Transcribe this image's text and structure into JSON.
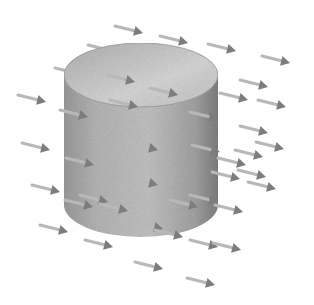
{
  "diagram": {
    "colors": {
      "background": "#ffffff",
      "cylinder_light": "#d4d4d4",
      "cylinder_mid": "#a8a8a8",
      "cylinder_dark": "#7a7a7a",
      "arrow_shaft": "#b8b8b8",
      "arrow_head": "#7d7d7d"
    },
    "field_direction": "right-downward",
    "arrow_count": 44
  }
}
